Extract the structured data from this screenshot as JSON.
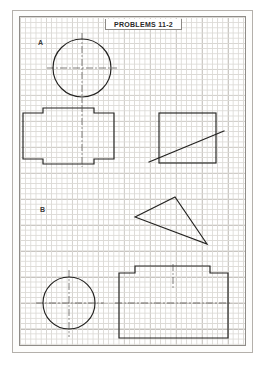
{
  "sheet": {
    "title": "PROBLEMS 11-2",
    "sections": [
      {
        "id": "A",
        "label": "A"
      },
      {
        "id": "B",
        "label": "B"
      }
    ],
    "grid": {
      "minor_spacing_px": 5.2,
      "major_spacing_px": 26,
      "minor_color": "#dcdad6",
      "major_color": "#c2bfba",
      "border_color": "#8f8c88"
    },
    "colors": {
      "ink": "#22211f",
      "centerline": "#4a4946",
      "paper": "#ffffff",
      "page_border": "#b4b0ab"
    }
  },
  "figures": [
    {
      "id": "circle-top",
      "section": "A",
      "type": "circle",
      "cx": 62,
      "cy": 51,
      "r": 29,
      "has_centerlines": true
    },
    {
      "id": "stepped-block-top",
      "section": "A",
      "type": "polygon",
      "points": "3,96 3,142 23,142 23,147 74,147 74,142 94,142 94,96 74,96 74,91 23,91 23,96",
      "has_centerline": true
    },
    {
      "id": "square-with-diagonal",
      "section": "A",
      "type": "rect",
      "x": 139,
      "y": 96,
      "width": 57,
      "height": 50,
      "diagonal": {
        "x1": 129,
        "y1": 145,
        "x2": 204,
        "y2": 114
      }
    },
    {
      "id": "triangle",
      "section": "B",
      "type": "triangle",
      "points": "115,200 155,180 187,227"
    },
    {
      "id": "circle-bottom",
      "section": "B",
      "type": "circle",
      "cx": 49,
      "cy": 286,
      "r": 26,
      "has_centerlines": true
    },
    {
      "id": "stepped-block-bottom",
      "section": "B",
      "type": "polygon",
      "points": "99,256 99,321 208,321 208,256 190,256 190,249 115,249 115,256",
      "has_centerline": true
    }
  ]
}
